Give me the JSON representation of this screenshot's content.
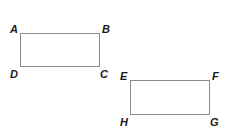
{
  "figure": {
    "rectangles": [
      {
        "name": "ABCD",
        "vertices": {
          "top_left": "A",
          "top_right": "B",
          "bottom_right": "C",
          "bottom_left": "D"
        }
      },
      {
        "name": "EFGH",
        "vertices": {
          "top_left": "E",
          "top_right": "F",
          "bottom_right": "G",
          "bottom_left": "H"
        }
      }
    ],
    "stroke_color": "#8c8c8c",
    "label_color": "#1a1a1a"
  }
}
